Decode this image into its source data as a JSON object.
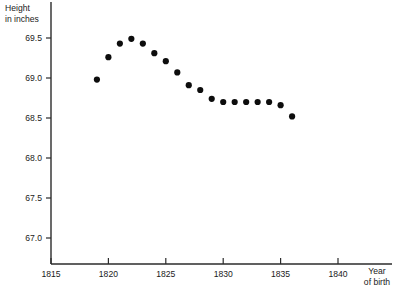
{
  "chart_data": {
    "type": "scatter",
    "title": "",
    "xlabel": "Year of birth",
    "ylabel": "Height in inches",
    "ylabel_line1": "Height",
    "ylabel_line2": "in inches",
    "xlabel_line1": "Year",
    "xlabel_line2": "of birth",
    "xlim": [
      1815,
      1841.5
    ],
    "ylim": [
      66.75,
      69.72
    ],
    "xticks": [
      1815,
      1820,
      1825,
      1830,
      1835,
      1840
    ],
    "xtick_labels": [
      "1815",
      "1820",
      "1825",
      "1830",
      "1835",
      "1840"
    ],
    "yticks": [
      67.0,
      67.5,
      68.0,
      68.5,
      69.0,
      69.5
    ],
    "ytick_labels": [
      "67.0",
      "67.5",
      "68.0",
      "68.5",
      "69.0",
      "69.5"
    ],
    "grid": false,
    "legend": null,
    "marker": "circle",
    "marker_color": "#0d0d0d",
    "marker_size": 3.1,
    "x": [
      1819,
      1820,
      1821,
      1822,
      1823,
      1824,
      1825,
      1826,
      1827,
      1828,
      1829,
      1830,
      1831,
      1832,
      1833,
      1834,
      1835,
      1836
    ],
    "y": [
      68.98,
      69.26,
      69.43,
      69.49,
      69.43,
      69.31,
      69.21,
      69.07,
      68.91,
      68.85,
      68.74,
      68.7,
      68.7,
      68.7,
      68.7,
      68.7,
      68.66,
      68.52
    ],
    "points": [
      {
        "x": 1819,
        "y": 68.98
      },
      {
        "x": 1820,
        "y": 69.26
      },
      {
        "x": 1821,
        "y": 69.43
      },
      {
        "x": 1822,
        "y": 69.49
      },
      {
        "x": 1823,
        "y": 69.43
      },
      {
        "x": 1824,
        "y": 69.31
      },
      {
        "x": 1825,
        "y": 69.21
      },
      {
        "x": 1826,
        "y": 69.07
      },
      {
        "x": 1827,
        "y": 68.91
      },
      {
        "x": 1828,
        "y": 68.85
      },
      {
        "x": 1829,
        "y": 68.74
      },
      {
        "x": 1830,
        "y": 68.7
      },
      {
        "x": 1831,
        "y": 68.7
      },
      {
        "x": 1832,
        "y": 68.7
      },
      {
        "x": 1833,
        "y": 68.7
      },
      {
        "x": 1834,
        "y": 68.7
      },
      {
        "x": 1835,
        "y": 68.66
      },
      {
        "x": 1836,
        "y": 68.52
      }
    ]
  },
  "colors": {
    "axis": "#2b2b2b",
    "marker": "#0d0d0d",
    "text": "#1a1a1a",
    "background": "#ffffff"
  }
}
